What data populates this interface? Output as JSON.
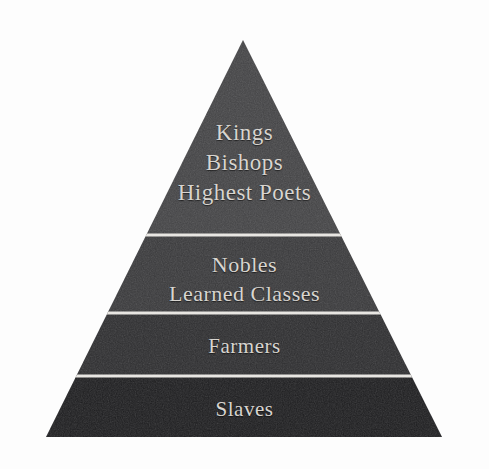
{
  "diagram": {
    "type": "pyramid",
    "background_color": "#fdfdfd",
    "text_color": "#d8d5d0",
    "divider_color": "#e8e6e2",
    "apex": {
      "x": 243,
      "y": 40
    },
    "base_left": {
      "x": 46,
      "y": 437
    },
    "base_right": {
      "x": 442,
      "y": 437
    },
    "tiers": [
      {
        "index": 1,
        "position": "top",
        "fill_color": "#444446",
        "top_y": 40,
        "bottom_y": 235,
        "lines": [
          "Kings",
          "Bishops",
          "Highest Poets"
        ]
      },
      {
        "index": 2,
        "position": "upper-middle",
        "fill_color": "#3a3a3c",
        "top_y": 235,
        "bottom_y": 313,
        "lines": [
          "Nobles",
          "Learned Classes"
        ]
      },
      {
        "index": 3,
        "position": "lower-middle",
        "fill_color": "#2e2e30",
        "top_y": 313,
        "bottom_y": 376,
        "lines": [
          "Farmers"
        ]
      },
      {
        "index": 4,
        "position": "bottom",
        "fill_color": "#1e1e20",
        "top_y": 376,
        "bottom_y": 437,
        "lines": [
          "Slaves"
        ]
      }
    ],
    "dividers": [
      {
        "y": 235
      },
      {
        "y": 313
      },
      {
        "y": 376
      }
    ]
  }
}
